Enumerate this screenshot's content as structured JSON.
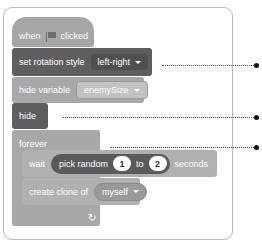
{
  "blocks": {
    "hat": {
      "pre": "when",
      "icon": "green-flag-icon",
      "post": "clicked"
    },
    "set_rotation": {
      "label": "set rotation style",
      "value": "left-right"
    },
    "hide_variable": {
      "label": "hide variable",
      "value": "enemySize"
    },
    "hide": {
      "label": "hide"
    },
    "forever": {
      "label": "forever",
      "loop_icon": "↻"
    },
    "wait": {
      "label": "wait",
      "reporter": "pick random",
      "from": "1",
      "to_label": "to",
      "to": "2",
      "unit": "seconds"
    },
    "create_clone": {
      "label": "create clone of",
      "value": "myself"
    }
  },
  "callouts": [
    {
      "target": "set rotation style",
      "y": 58
    },
    {
      "target": "hide",
      "y": 114
    },
    {
      "target": "forever",
      "y": 143
    }
  ],
  "colors": {
    "dark_block": "#5e5e5e",
    "light_block": "#a8a8a8",
    "frame_border": "#b9b9b9",
    "callout_dot": "#111111"
  }
}
